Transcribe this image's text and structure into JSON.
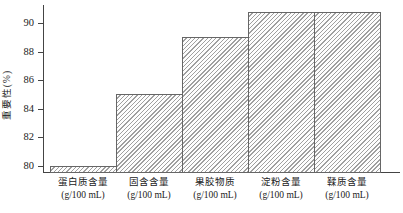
{
  "chart_data": {
    "type": "bar",
    "title": "",
    "ylabel": "重要性(%)",
    "xlabel": "",
    "categories": [
      "蛋白质含量",
      "固含含量",
      "果胶物质",
      "淀粉含量",
      "鞣质含量"
    ],
    "category_unit": "(g/100 mL)",
    "values": [
      80.0,
      85.0,
      89.0,
      90.8,
      90.8
    ],
    "yticks": [
      80,
      82,
      84,
      86,
      88,
      90
    ],
    "ylim": [
      79.55,
      91.3
    ],
    "grid": false,
    "legend": "none",
    "hatch": "diagonal-lines",
    "colors": {
      "bar_fill": "#fdfdfd",
      "hatch_line": "#9f9f9f",
      "bar_edge": "#666666",
      "axis": "#444444",
      "text": "#222222",
      "background": "#ffffff"
    }
  }
}
